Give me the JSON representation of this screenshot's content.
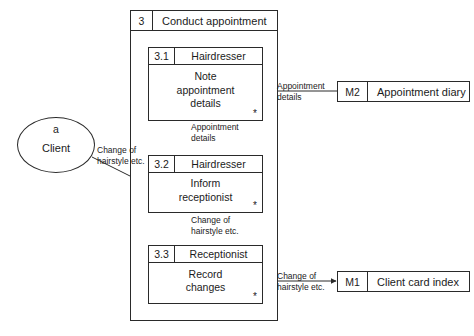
{
  "diagram": {
    "type": "data-flow-diagram",
    "outer_process": {
      "id": "3",
      "title": "Conduct appointment"
    },
    "processes": [
      {
        "id": "3.1",
        "actor": "Hairdresser",
        "action_line1": "Note",
        "action_line2": "appointment",
        "action_line3": "details",
        "iteration": "*"
      },
      {
        "id": "3.2",
        "actor": "Hairdresser",
        "action_line1": "Inform",
        "action_line2": "receptionist",
        "action_line3": "",
        "iteration": "*"
      },
      {
        "id": "3.3",
        "actor": "Receptionist",
        "action_line1": "Record",
        "action_line2": "changes",
        "action_line3": "",
        "iteration": "*"
      }
    ],
    "stores": [
      {
        "id": "M2",
        "name": "Appointment diary"
      },
      {
        "id": "M1",
        "name": "Client card index"
      }
    ],
    "entities": [
      {
        "id": "a",
        "name": "Client"
      }
    ],
    "flows": [
      {
        "line1": "Appointment",
        "line2": "details"
      },
      {
        "line1": "Appointment",
        "line2": "details"
      },
      {
        "line1": "Change of",
        "line2": "hairstyle etc."
      },
      {
        "line1": "Change of",
        "line2": "hairstyle etc."
      },
      {
        "line1": "Change of",
        "line2": "hairstyle etc."
      }
    ]
  },
  "colors": {
    "stroke": "#2a2a2a",
    "background": "#ffffff",
    "text": "#1b1b1b"
  }
}
